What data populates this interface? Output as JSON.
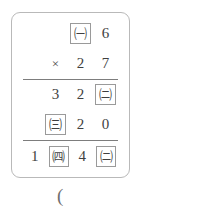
{
  "problem": {
    "type": "vertical-multiplication",
    "rows": [
      {
        "name": "multiplicand",
        "cells": [
          {
            "text": "",
            "kind": "blank"
          },
          {
            "text": "㈠",
            "kind": "boxed"
          },
          {
            "text": "6",
            "kind": "digit"
          }
        ]
      },
      {
        "name": "multiplier",
        "cells": [
          {
            "text": "×",
            "kind": "op"
          },
          {
            "text": "2",
            "kind": "digit"
          },
          {
            "text": "7",
            "kind": "digit"
          }
        ]
      },
      {
        "name": "partial-product-1",
        "cells": [
          {
            "text": "3",
            "kind": "digit"
          },
          {
            "text": "2",
            "kind": "digit"
          },
          {
            "text": "㈡",
            "kind": "boxed"
          }
        ]
      },
      {
        "name": "partial-product-2",
        "cells": [
          {
            "text": "㈢",
            "kind": "boxed"
          },
          {
            "text": "2",
            "kind": "digit"
          },
          {
            "text": "0",
            "kind": "digit"
          }
        ]
      },
      {
        "name": "total",
        "cells": [
          {
            "text": "1",
            "kind": "digit"
          },
          {
            "text": "㈣",
            "kind": "boxed"
          },
          {
            "text": "4",
            "kind": "digit"
          },
          {
            "text": "㈡",
            "kind": "boxed"
          }
        ]
      }
    ],
    "unknown_labels": [
      "㈠",
      "㈡",
      "㈢",
      "㈣"
    ]
  },
  "answer_prompt": {
    "text": "("
  },
  "colors": {
    "frame_border": "#b9b9b9",
    "box_border": "#9a9a9a",
    "rule": "#7d7d7d",
    "text": "#3f3f3f",
    "background": "#ffffff"
  }
}
